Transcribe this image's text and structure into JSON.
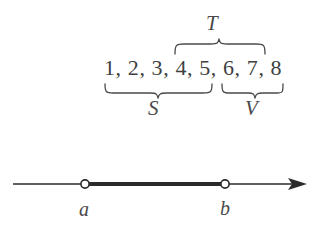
{
  "figure": {
    "background_color": "#ffffff",
    "ink_color": "#3f3f3f"
  },
  "set_notation": {
    "numbers_text": "1, 2, 3, 4, 5, 6, 7, 8",
    "numbers": [
      1,
      2,
      3,
      4,
      5,
      6,
      7,
      8
    ],
    "overbrace": {
      "label": "T",
      "covers": [
        4,
        5,
        6,
        7,
        8
      ],
      "position": "above"
    },
    "underbraces": [
      {
        "label": "S",
        "covers": [
          1,
          2,
          3,
          4,
          5
        ],
        "position": "below"
      },
      {
        "label": "V",
        "covers": [
          6,
          7,
          8
        ],
        "position": "below"
      }
    ]
  },
  "number_line": {
    "left_endpoint_label": "a",
    "right_endpoint_label": "b",
    "left_endpoint_type": "open-circle",
    "right_endpoint_type": "open-circle",
    "segment_style": "thick",
    "arrow_direction": "right",
    "axis_color": "#2b2b2b"
  }
}
